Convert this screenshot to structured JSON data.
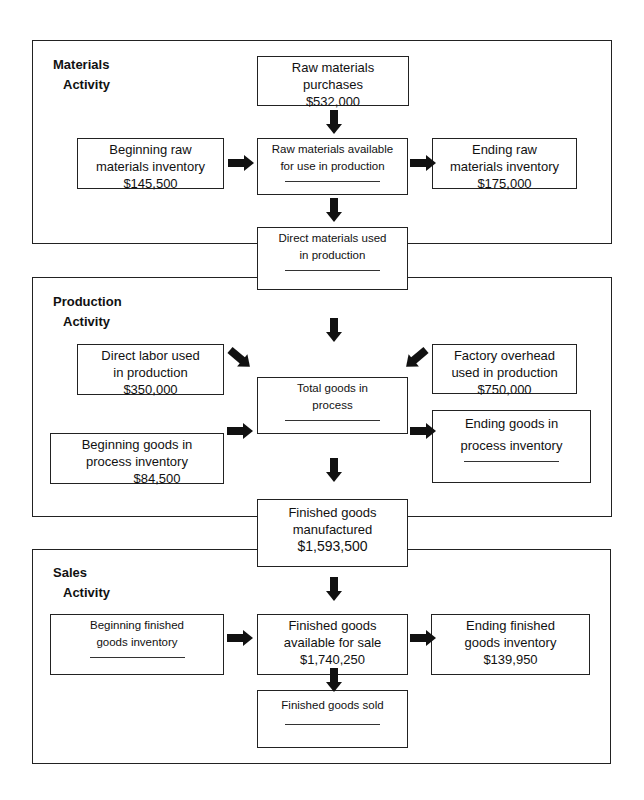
{
  "sections": {
    "materials": {
      "title_line1": "Materials",
      "title_line2": "Activity"
    },
    "production": {
      "title_line1": "Production",
      "title_line2": "Activity"
    },
    "sales": {
      "title_line1": "Sales",
      "title_line2": "Activity"
    }
  },
  "nodes": {
    "raw_purchases": {
      "line1": "Raw materials",
      "line2": "purchases",
      "value": "$532,000"
    },
    "beginning_raw": {
      "line1": "Beginning raw",
      "line2": "materials inventory",
      "value": "$145,500"
    },
    "raw_available": {
      "line1": "Raw materials available",
      "line2": "for use in production",
      "value": ""
    },
    "ending_raw": {
      "line1": "Ending raw",
      "line2": "materials inventory",
      "value": "$175,000"
    },
    "direct_materials": {
      "line1": "Direct materials used",
      "line2": "in production",
      "value": ""
    },
    "direct_labor": {
      "line1": "Direct labor used",
      "line2": "in production",
      "value": "$350,000"
    },
    "factory_overhead": {
      "line1": "Factory overhead",
      "line2": "used in production",
      "value": "$750,000"
    },
    "total_goods": {
      "line1": "Total goods in",
      "line2": "process",
      "value": ""
    },
    "beginning_gip": {
      "line1": "Beginning goods in",
      "line2": "process inventory",
      "value": "$84,500"
    },
    "ending_gip": {
      "line1": "Ending goods in",
      "line2": "process inventory",
      "value": ""
    },
    "finished_manufactured": {
      "line1": "Finished goods",
      "line2": "manufactured",
      "value": "$1,593,500"
    },
    "beginning_fg": {
      "line1": "Beginning finished",
      "line2": "goods inventory",
      "value": ""
    },
    "fg_available": {
      "line1": "Finished goods",
      "line2": "available for sale",
      "value": "$1,740,250"
    },
    "ending_fg": {
      "line1": "Ending finished",
      "line2": "goods inventory",
      "value": "$139,950"
    },
    "fg_sold": {
      "line1": "Finished goods sold",
      "value": ""
    }
  }
}
